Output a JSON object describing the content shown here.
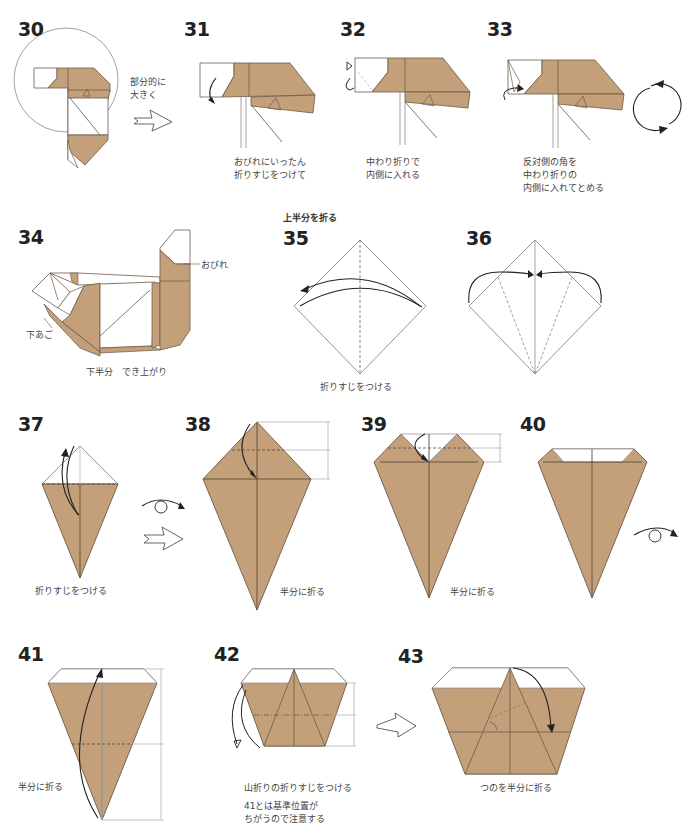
{
  "colors": {
    "paper_brown": "#c4a07a",
    "paper_white": "#ffffff",
    "line": "#6b5a48",
    "arrow": "#222222"
  },
  "steps": [
    {
      "num": "30",
      "caption": "部分的に\n大きく"
    },
    {
      "num": "31",
      "caption": "おびれにいったん\n折りすじをつけて"
    },
    {
      "num": "32",
      "caption": "中わり折りで\n内側に入れる"
    },
    {
      "num": "33",
      "caption": "反対側の角を\n中わり折りの\n内側に入れてとめる"
    },
    {
      "num": "34",
      "caption": "下半分　でき上がり",
      "labels": {
        "tail": "おびれ",
        "jaw": "下あご"
      }
    },
    {
      "num": "35",
      "caption": "折りすじをつける",
      "section_title": "上半分を折る"
    },
    {
      "num": "36",
      "caption": ""
    },
    {
      "num": "37",
      "caption": "折りすじをつける"
    },
    {
      "num": "38",
      "caption": "半分に折る"
    },
    {
      "num": "39",
      "caption": "半分に折る"
    },
    {
      "num": "40",
      "caption": ""
    },
    {
      "num": "41",
      "caption": "半分に折る"
    },
    {
      "num": "42",
      "caption": "山折りの折りすじをつける",
      "note": "41とは基準位置が\nちがうので注意する",
      "ruby": "きじゅん"
    },
    {
      "num": "43",
      "caption": "つのを半分に折る"
    }
  ],
  "icons": {
    "next_arrow": "hollow-right-arrow-icon",
    "rotate": "rotate-icon",
    "flip": "flip-over-icon"
  }
}
